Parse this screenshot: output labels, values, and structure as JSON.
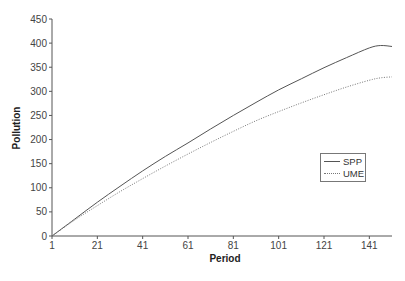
{
  "chart_data": {
    "type": "line",
    "title": "",
    "xlabel": "Period",
    "ylabel": "Pollution",
    "xlim": [
      1,
      151
    ],
    "ylim": [
      0,
      450
    ],
    "x_ticks": [
      "1",
      "21",
      "41",
      "61",
      "81",
      "101",
      "121",
      "141"
    ],
    "y_ticks": [
      "0",
      "50",
      "100",
      "150",
      "200",
      "250",
      "300",
      "350",
      "400",
      "450"
    ],
    "grid": false,
    "legend_position": "right-center",
    "x": [
      1,
      11,
      21,
      31,
      41,
      51,
      61,
      71,
      81,
      91,
      101,
      111,
      121,
      131,
      141,
      146,
      151
    ],
    "series": [
      {
        "name": "SPP",
        "style": "solid",
        "values": [
          0,
          35,
          70,
          103,
          135,
          165,
          193,
          222,
          250,
          277,
          303,
          326,
          349,
          370,
          390,
          395,
          393
        ]
      },
      {
        "name": "UME",
        "style": "dotted",
        "values": [
          0,
          33,
          63,
          92,
          119,
          145,
          170,
          194,
          217,
          239,
          258,
          276,
          293,
          309,
          323,
          328,
          330
        ]
      }
    ]
  },
  "legend": {
    "items": [
      {
        "label": "SPP"
      },
      {
        "label": "UME"
      }
    ]
  }
}
